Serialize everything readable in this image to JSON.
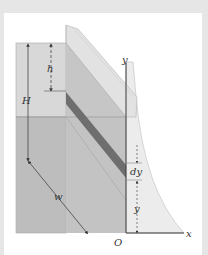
{
  "figure": {
    "type": "engineering-diagram",
    "labels": {
      "h": "h",
      "H": "H",
      "w": "w",
      "y_axis": "y",
      "x_axis": "x",
      "dy": "dy",
      "y": "y",
      "origin": "O"
    },
    "colors": {
      "background": "#e6e6e6",
      "panel": "#ffffff",
      "box_top_face": "#d8d8d8",
      "box_lower_face": "#bdbdbd",
      "gate_face": "#c9c9c9",
      "gate_edge": "#e4e4e4",
      "stripe": "#6e6e6e",
      "pressure_region": "#ececec",
      "axis": "#3a3a3a"
    }
  }
}
